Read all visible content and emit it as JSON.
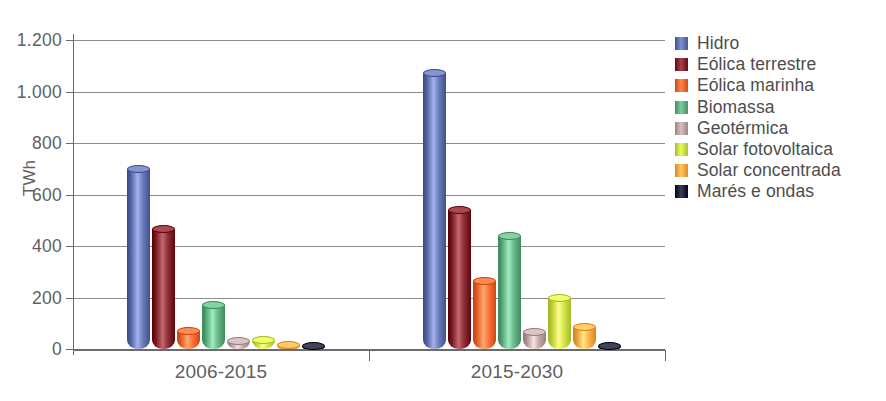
{
  "chart_data": {
    "type": "bar",
    "title": "",
    "subtitle": "",
    "xlabel": "",
    "ylabel": "TWh",
    "categories": [
      "2006-2015",
      "2015-2030"
    ],
    "ylim": [
      0,
      1200
    ],
    "ytick_labels": [
      "0",
      "200",
      "400",
      "600",
      "800",
      "1.000",
      "1.200"
    ],
    "ytick_values": [
      0,
      200,
      400,
      600,
      800,
      1000,
      1200
    ],
    "grid": true,
    "legend_position": "right",
    "series": [
      {
        "name": "Hidro",
        "color": "#5b6ba8",
        "values": [
          700,
          1070
        ]
      },
      {
        "name": "Eólica terrestre",
        "color": "#7d2028",
        "values": [
          465,
          540
        ]
      },
      {
        "name": "Eólica marinha",
        "color": "#e8622a",
        "values": [
          70,
          265
        ]
      },
      {
        "name": "Biomassa",
        "color": "#5aa87a",
        "values": [
          170,
          437
        ]
      },
      {
        "name": "Geotérmica",
        "color": "#b39b9b",
        "values": [
          30,
          65
        ]
      },
      {
        "name": "Solar fotovoltaica",
        "color": "#c3d63f",
        "values": [
          35,
          200
        ]
      },
      {
        "name": "Solar concentrada",
        "color": "#f2a23c",
        "values": [
          15,
          85
        ]
      },
      {
        "name": "Marés e ondas",
        "color": "#161a2e",
        "values": [
          3,
          12
        ]
      }
    ]
  },
  "axis": {
    "y_title": "TWh"
  }
}
